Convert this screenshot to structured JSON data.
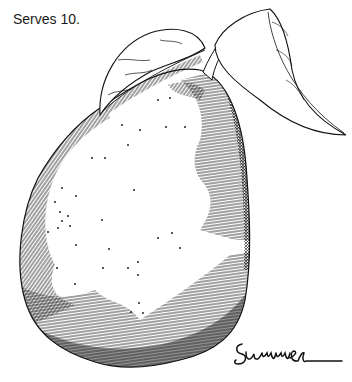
{
  "caption": "Serves 10.",
  "illustration": {
    "subject": "pear-with-leaves",
    "style": "pen-and-ink hatching",
    "ink_color": "#111111",
    "paper_color": "#ffffff"
  },
  "signature": "Summer"
}
